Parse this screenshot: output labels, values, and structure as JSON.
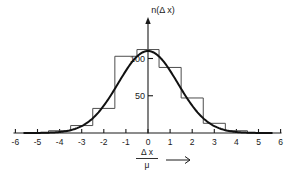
{
  "chart_data": {
    "type": "bar",
    "title": "",
    "subtitle": "",
    "xlabel_numerator": "Δ x",
    "xlabel_denominator": "μ",
    "xlabel_arrow": "⟶",
    "ylabel": "n(Δ x)",
    "xlim": [
      -6,
      6
    ],
    "ylim": [
      0,
      130
    ],
    "grid": false,
    "legend": null,
    "x_tick_labels": [
      "-6",
      "-5",
      "-4",
      "-3",
      "-2",
      "-1",
      "0",
      "1",
      "2",
      "3",
      "4",
      "5",
      "6"
    ],
    "x_tick_values": [
      -6,
      -5,
      -4,
      -3,
      -2,
      -1,
      0,
      1,
      2,
      3,
      4,
      5,
      6
    ],
    "y_tick_labels": [
      "50",
      "100"
    ],
    "y_tick_values": [
      50,
      100
    ],
    "bin_width": 1,
    "bin_edges": [
      -4.5,
      -3.5,
      -2.5,
      -1.5,
      -0.5,
      0.5,
      1.5,
      2.5,
      3.5,
      4.5
    ],
    "categories": [
      "-4",
      "-3",
      "-2",
      "-1",
      "0",
      "1",
      "2",
      "3",
      "4"
    ],
    "values": [
      3,
      10,
      33,
      103,
      112,
      88,
      47,
      13,
      3
    ],
    "overlay_curve": {
      "name": "gaussian-fit",
      "amplitude": 110,
      "mean": 0,
      "sigma": 1.35,
      "x_start": -5.6,
      "x_end": 5.6
    },
    "colors": {
      "axis": "#1a1a1a",
      "histogram": "#4d4d4d",
      "curve": "#111111",
      "background": "#ffffff"
    }
  }
}
